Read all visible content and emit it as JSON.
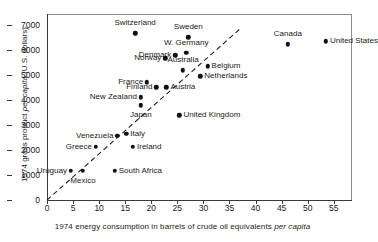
{
  "chart_data": {
    "type": "scatter",
    "title": "",
    "xlabel": "1974 energy consumption in barrels of crude oil equivalents per capita",
    "ylabel": "1974 gross product per capita (U.S. dollars)",
    "xlim": [
      0,
      58.5
    ],
    "ylim": [
      0,
      7450
    ],
    "xticks": [
      0,
      5,
      10,
      15,
      20,
      25,
      30,
      35,
      40,
      45,
      50,
      55
    ],
    "yticks": [
      0,
      1000,
      2000,
      3000,
      4000,
      5000,
      6000,
      7000
    ],
    "grid": false,
    "legend": false,
    "annotations": [
      {
        "name": "trend-line",
        "type": "dashed-line",
        "from": [
          0,
          0
        ],
        "to": [
          37,
          6850
        ]
      }
    ],
    "points": [
      {
        "label": "Switzerland",
        "x": 16.9,
        "y": 6680,
        "label_pos": "above"
      },
      {
        "label": "Sweden",
        "x": 27.1,
        "y": 6520,
        "label_pos": "above"
      },
      {
        "label": "Canada",
        "x": 46.2,
        "y": 6240,
        "label_pos": "above"
      },
      {
        "label": "United States",
        "x": 53.5,
        "y": 6360,
        "label_pos": "right"
      },
      {
        "label": "W. Germany",
        "x": 26.7,
        "y": 5900,
        "label_pos": "above"
      },
      {
        "label": "Denmark",
        "x": 24.6,
        "y": 5800,
        "label_pos": "left"
      },
      {
        "label": "Norway",
        "x": 22.7,
        "y": 5680,
        "label_pos": "left"
      },
      {
        "label": "Australia",
        "x": 26.1,
        "y": 5200,
        "label_pos": "above"
      },
      {
        "label": "Belgium",
        "x": 30.8,
        "y": 5360,
        "label_pos": "right"
      },
      {
        "label": "Netherlands",
        "x": 29.4,
        "y": 4960,
        "label_pos": "right"
      },
      {
        "label": "France",
        "x": 19.2,
        "y": 4720,
        "label_pos": "left"
      },
      {
        "label": "Finland",
        "x": 21.0,
        "y": 4520,
        "label_pos": "left"
      },
      {
        "label": "Austria",
        "x": 22.9,
        "y": 4520,
        "label_pos": "right"
      },
      {
        "label": "New Zealand",
        "x": 18.0,
        "y": 4120,
        "label_pos": "left"
      },
      {
        "label": "Japan",
        "x": 18.0,
        "y": 3800,
        "label_pos": "below"
      },
      {
        "label": "United Kingdom",
        "x": 25.4,
        "y": 3400,
        "label_pos": "right"
      },
      {
        "label": "Venezuela",
        "x": 13.5,
        "y": 2560,
        "label_pos": "left"
      },
      {
        "label": "Italy",
        "x": 15.2,
        "y": 2640,
        "label_pos": "right"
      },
      {
        "label": "Ireland",
        "x": 16.5,
        "y": 2120,
        "label_pos": "right"
      },
      {
        "label": "Greece",
        "x": 9.4,
        "y": 2120,
        "label_pos": "left"
      },
      {
        "label": "Uruguay",
        "x": 4.6,
        "y": 1160,
        "label_pos": "left"
      },
      {
        "label": "Mexico",
        "x": 6.9,
        "y": 1160,
        "label_pos": "below"
      },
      {
        "label": "South Africa",
        "x": 13.0,
        "y": 1180,
        "label_pos": "right"
      }
    ]
  }
}
